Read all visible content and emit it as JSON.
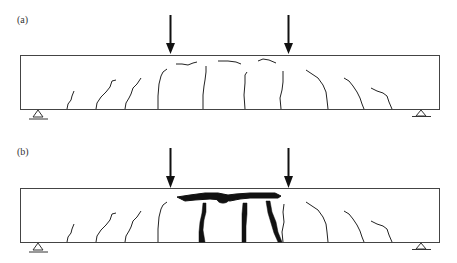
{
  "figure": {
    "type": "beam crack pattern diagram",
    "panels": [
      {
        "label": "(a)",
        "description": "Simply supported beam under two-point loading with flexural/shear cracks and minor compression-zone cracks",
        "beam": {
          "x": 20,
          "y": 55,
          "width": 419,
          "height": 54
        },
        "loads": [
          170,
          288
        ],
        "supports": [
          38,
          421
        ]
      },
      {
        "label": "(b)",
        "description": "Same beam at failure with wide dark crushing and flexural cracks in constant-moment region",
        "beam": {
          "x": 20,
          "y": 188,
          "width": 419,
          "height": 54
        },
        "loads": [
          170,
          288
        ],
        "supports": [
          38,
          421
        ]
      }
    ]
  },
  "colors": {
    "line": "#333333",
    "crack": "#222222",
    "heavy_crack": "#111111",
    "background": "#ffffff"
  }
}
